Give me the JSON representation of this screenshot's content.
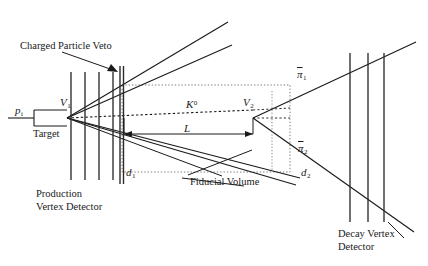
{
  "figure": {
    "kind": "particle-physics-detector-schematic",
    "background_color": "#ffffff",
    "line_color": "#1a1a1a",
    "canvas": {
      "width": 428,
      "height": 266
    }
  },
  "labels": {
    "charged_particle_veto": "Charged Particle Veto",
    "beam_particle": "p",
    "beam_particle_sub": "i",
    "production_vertex": "V",
    "production_vertex_sub": "1",
    "target": "Target",
    "production_vertex_detector_line1": "Production",
    "production_vertex_detector_line2": "Vertex Detector",
    "kaon": "K",
    "kaon_sup": "0",
    "decay_length": "L",
    "decay_vertex": "V",
    "decay_vertex_sub": "2",
    "impact_parameter_1": "d",
    "impact_parameter_1_sub": "1",
    "impact_parameter_2": "d",
    "impact_parameter_2_sub": "2",
    "fiducial_volume": "Fiducial Volume",
    "pion_1": "π",
    "pion_1_sub": "1",
    "pion_2": "π",
    "pion_2_sub": "2",
    "decay_vertex_detector_line1": "Decay Vertex",
    "decay_vertex_detector_line2": "Detector"
  },
  "geometry": {
    "beam_axis_y": 118,
    "target": {
      "x": 34,
      "y": 110,
      "width": 33,
      "height": 16
    },
    "production_vertex_point": {
      "x": 67,
      "y": 118
    },
    "decay_vertex_point": {
      "x": 253,
      "y": 118
    },
    "production_detector_planes_x": [
      71,
      85,
      99,
      113
    ],
    "production_detector_plane_top": 72,
    "production_detector_plane_bottom": 180,
    "veto_plane_x": 121,
    "veto_plane_top": 66,
    "veto_plane_bottom": 184,
    "decay_detector_planes_x": [
      350,
      368,
      384
    ],
    "decay_detector_plane_top": 53,
    "decay_detector_plane_bottom": 222,
    "fiducial_volume_box": {
      "x1": 122,
      "y1": 85,
      "x2": 290,
      "y2": 172
    },
    "length_arrow": {
      "x1": 124,
      "x2": 253,
      "y": 134
    }
  }
}
